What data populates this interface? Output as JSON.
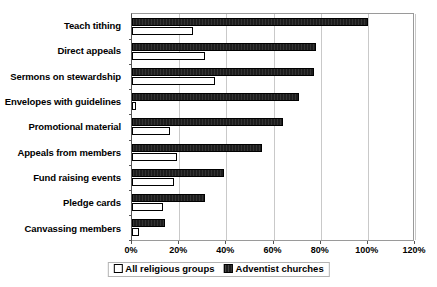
{
  "chart_data": {
    "type": "bar",
    "orientation": "horizontal",
    "title": "",
    "subtitle": "",
    "xlabel": "",
    "ylabel": "",
    "xlim": [
      0,
      120
    ],
    "xticks": [
      0,
      20,
      40,
      60,
      80,
      100,
      120
    ],
    "xtick_labels": [
      "0%",
      "20%",
      "40%",
      "60%",
      "80%",
      "100%",
      "120%"
    ],
    "grid": "vertical",
    "legend_position": "bottom-center",
    "categories": [
      "Teach tithing",
      "Direct appeals",
      "Sermons on stewardship",
      "Envelopes with guidelines",
      "Promotional material",
      "Appeals from members",
      "Fund raising events",
      "Pledge cards",
      "Canvassing members"
    ],
    "series": [
      {
        "name": "Adventist churches",
        "style": "filled-black",
        "color": "#1d1d1d",
        "values": [
          100,
          78,
          77,
          71,
          64,
          55,
          39,
          31,
          14
        ]
      },
      {
        "name": "All religious groups",
        "style": "outline-white",
        "color": "#ffffff",
        "values": [
          26,
          31,
          35,
          1,
          16,
          19,
          18,
          13,
          3
        ]
      }
    ]
  },
  "legend": {
    "items": [
      {
        "label": "All religious groups",
        "swatch": "white-square"
      },
      {
        "label": "Adventist churches",
        "swatch": "black-square"
      }
    ]
  }
}
